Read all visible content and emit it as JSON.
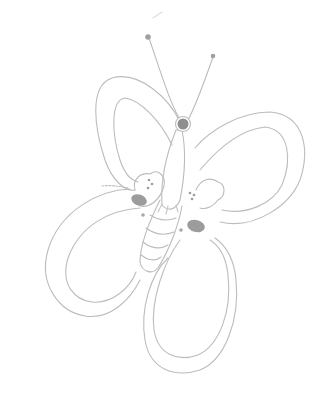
{
  "image": {
    "subject": "butterfly pencil sketch",
    "caption": "Butterfly drawing"
  },
  "colors": {
    "background": "#ffffff",
    "line": "#b8b8b8",
    "shade": "#9a9a9a",
    "dark": "#8a8a8a"
  }
}
